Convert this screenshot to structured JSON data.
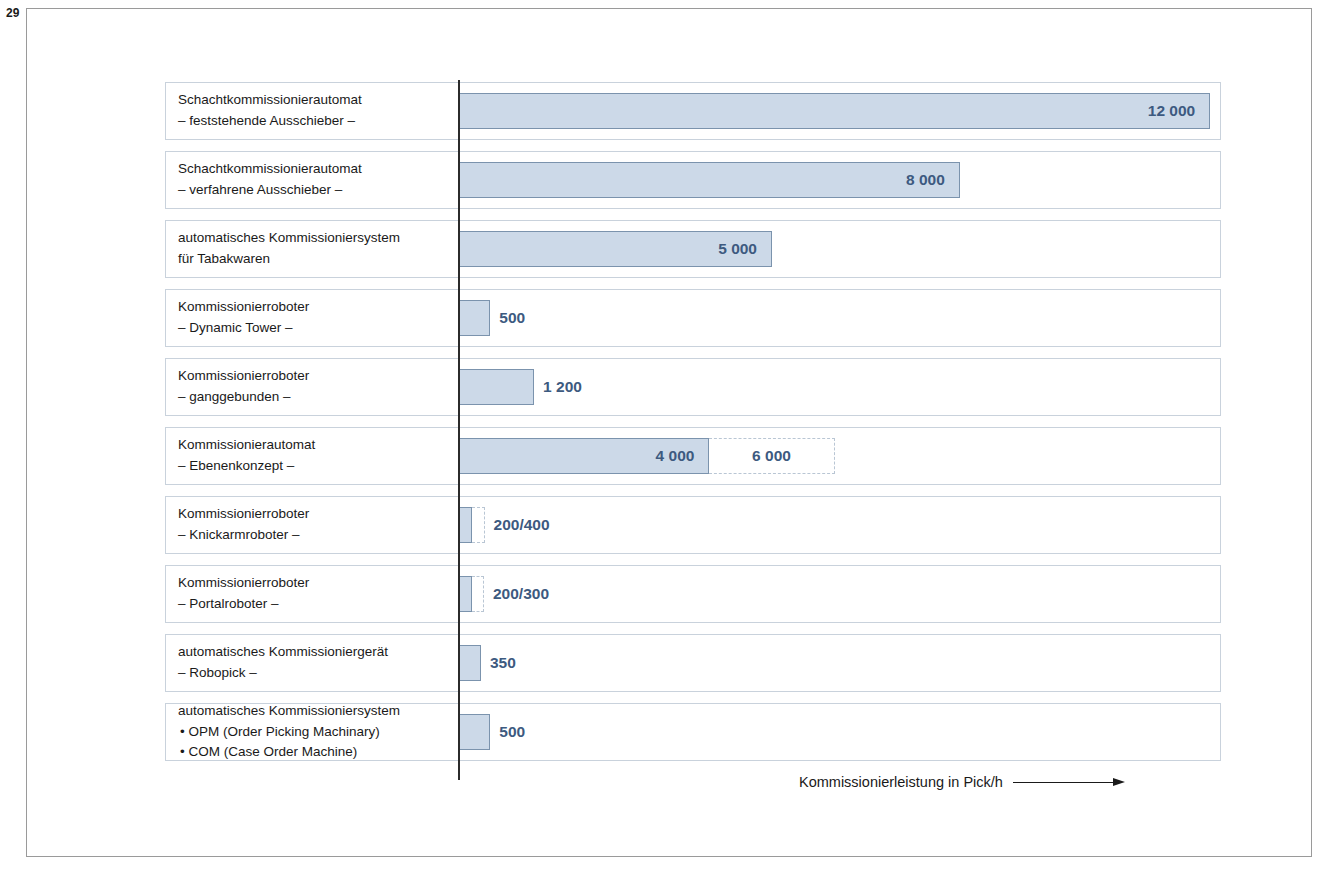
{
  "page_number": "29",
  "chart_data": {
    "type": "bar",
    "orientation": "horizontal",
    "title": "",
    "xlabel": "Kommissionierleistung in Pick/h",
    "ylabel": "",
    "xlim": [
      0,
      12600
    ],
    "grid": false,
    "legend": null,
    "axis_arrow": true,
    "categories": [
      "Schachtkommissionierautomat – feststehende Ausschieber –",
      "Schachtkommissionierautomat – verfahrene Ausschieber –",
      "automatisches Kommissioniersystem für Tabakwaren",
      "Kommissionierroboter – Dynamic Tower –",
      "Kommissionierroboter – ganggebunden –",
      "Kommissionierautomat – Ebenenkonzept –",
      "Kommissionierroboter – Knickarmroboter –",
      "Kommissionierroboter – Portalroboter –",
      "automatisches Kommissioniergerät – Robopick –",
      "automatisches Kommissioniersystem • OPM (Order Picking Machinary) • COM (Case Order Machine)"
    ],
    "values": [
      12000,
      8000,
      5000,
      500,
      1200,
      4000,
      200,
      200,
      350,
      500
    ],
    "range_upper": [
      null,
      null,
      null,
      null,
      null,
      6000,
      400,
      300,
      null,
      null
    ],
    "value_labels": [
      "12 000",
      "8 000",
      "5 000",
      "500",
      "1 200",
      "4 000",
      "200/400",
      "200/300",
      "350",
      "500"
    ],
    "extension_labels": [
      null,
      null,
      null,
      null,
      null,
      "6 000",
      null,
      null,
      null,
      null
    ]
  },
  "rows": [
    {
      "label_lines": [
        "Schachtkommissionierautomat",
        "– feststehende Ausschieber –"
      ],
      "value": 12000,
      "value_label": "12 000",
      "label_placement": "inside",
      "extension": null,
      "extension_label": null
    },
    {
      "label_lines": [
        "Schachtkommissionierautomat",
        "– verfahrene Ausschieber –"
      ],
      "value": 8000,
      "value_label": "8 000",
      "label_placement": "inside",
      "extension": null,
      "extension_label": null
    },
    {
      "label_lines": [
        "automatisches Kommissioniersystem",
        "für Tabakwaren"
      ],
      "value": 5000,
      "value_label": "5 000",
      "label_placement": "inside",
      "extension": null,
      "extension_label": null
    },
    {
      "label_lines": [
        "Kommissionierroboter",
        "– Dynamic Tower –"
      ],
      "value": 500,
      "value_label": "500",
      "label_placement": "outside",
      "extension": null,
      "extension_label": null
    },
    {
      "label_lines": [
        "Kommissionierroboter",
        "– ganggebunden –"
      ],
      "value": 1200,
      "value_label": "1 200",
      "label_placement": "outside",
      "extension": null,
      "extension_label": null
    },
    {
      "label_lines": [
        "Kommissionierautomat",
        "– Ebenenkonzept –"
      ],
      "value": 4000,
      "value_label": "4 000",
      "label_placement": "inside",
      "extension": 6000,
      "extension_label": "6 000"
    },
    {
      "label_lines": [
        "Kommissionierroboter",
        "– Knickarmroboter –"
      ],
      "value": 200,
      "value_label": "200/400",
      "label_placement": "outside",
      "extension": 400,
      "extension_label": null
    },
    {
      "label_lines": [
        "Kommissionierroboter",
        "– Portalroboter –"
      ],
      "value": 200,
      "value_label": "200/300",
      "label_placement": "outside",
      "extension": 300,
      "extension_label": null
    },
    {
      "label_lines": [
        "automatisches Kommissioniergerät",
        "– Robopick –"
      ],
      "value": 350,
      "value_label": "350",
      "label_placement": "outside",
      "extension": null,
      "extension_label": null
    },
    {
      "label_lines": [
        "automatisches Kommissioniersystem",
        "• OPM (Order Picking Machinary)",
        "• COM (Case Order Machine)"
      ],
      "value": 500,
      "value_label": "500",
      "label_placement": "outside",
      "extension": null,
      "extension_label": null
    }
  ],
  "axis": {
    "caption": "Kommissionierleistung in Pick/h"
  },
  "colors": {
    "bar_fill": "#ccd9e8",
    "bar_border": "#7b93ad",
    "value_text": "#3d5a80",
    "row_border": "#c9d2dc",
    "frame_border": "#9a9a9a",
    "axis_line": "#2b2b2b",
    "label_text": "#1a1a1a"
  }
}
